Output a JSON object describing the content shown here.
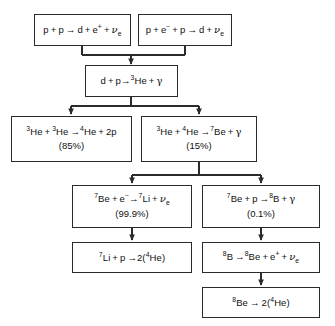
{
  "diagram": {
    "line_color": "#2b2b2b",
    "background": "#ffffff",
    "nodes": [
      {
        "id": "pp1",
        "name": "reaction-pp1",
        "equation": "p + p → d + e⁺ + νₑ",
        "percent": ""
      },
      {
        "id": "pep",
        "name": "reaction-pep",
        "equation": "p + e⁻ + p → d + νₑ",
        "percent": ""
      },
      {
        "id": "dp",
        "name": "reaction-deuterium-proton",
        "equation": "d + p → ³He + γ",
        "percent": ""
      },
      {
        "id": "he3he3",
        "name": "reaction-ppi-branch",
        "equation": "³He + ³He → ⁴He + 2p",
        "percent": "(85%)"
      },
      {
        "id": "he3he4",
        "name": "reaction-ppii-ppiii-branch",
        "equation": "³He + ⁴He → ⁷Be + γ",
        "percent": "(15%)"
      },
      {
        "id": "be7e",
        "name": "reaction-be7-electron-capture",
        "equation": "⁷Be + e⁻ → ⁷Li + νₑ",
        "percent": "(99.9%)"
      },
      {
        "id": "be7p",
        "name": "reaction-be7-proton-capture",
        "equation": "⁷Be + p → ⁸B + γ",
        "percent": "(0.1%)"
      },
      {
        "id": "li7p",
        "name": "reaction-li7-proton",
        "equation": "⁷Li + p → 2(⁴He)",
        "percent": ""
      },
      {
        "id": "b8",
        "name": "reaction-b8-decay",
        "equation": "⁸B → ⁸Be + e⁺ + νₑ",
        "percent": ""
      },
      {
        "id": "be8",
        "name": "reaction-be8-decay",
        "equation": "⁸Be → 2(⁴He)",
        "percent": ""
      }
    ]
  }
}
